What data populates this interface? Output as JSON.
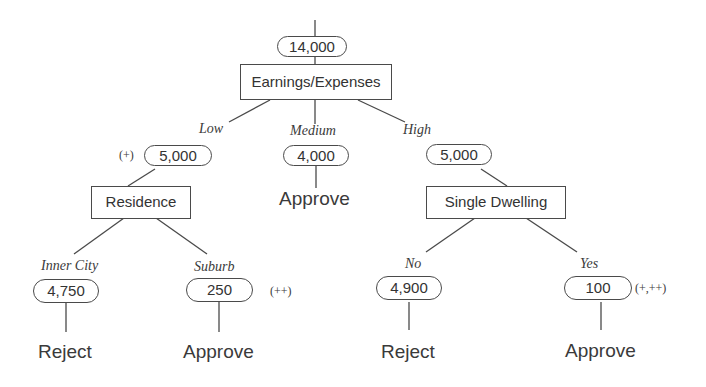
{
  "root": {
    "count": "14,000",
    "split": "Earnings/Expenses"
  },
  "branches": {
    "low": {
      "edge": "Low",
      "count": "5,000",
      "mark": "(+)",
      "split": "Residence",
      "children": [
        {
          "edge": "Inner City",
          "count": "4,750",
          "decision": "Reject",
          "mark": ""
        },
        {
          "edge": "Suburb",
          "count": "250",
          "decision": "Approve",
          "mark": "(++)"
        }
      ]
    },
    "medium": {
      "edge": "Medium",
      "count": "4,000",
      "decision": "Approve"
    },
    "high": {
      "edge": "High",
      "count": "5,000",
      "split": "Single Dwelling",
      "children": [
        {
          "edge": "No",
          "count": "4,900",
          "decision": "Reject",
          "mark": ""
        },
        {
          "edge": "Yes",
          "count": "100",
          "decision": "Approve",
          "mark": "(+,++)"
        }
      ]
    }
  },
  "colors": {
    "line": "#4a4a4a",
    "text": "#333333",
    "background": "#ffffff"
  }
}
